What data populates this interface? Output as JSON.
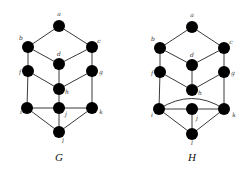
{
  "graphs": [
    {
      "name": "G",
      "label_pos": [
        59,
        161
      ],
      "nodes": [
        {
          "id": "a",
          "x": 59,
          "y": 26,
          "lx": 59,
          "ly": 16,
          "anchor": "middle"
        },
        {
          "id": "b",
          "x": 28,
          "y": 47,
          "lx": 21,
          "ly": 40,
          "anchor": "middle"
        },
        {
          "id": "c",
          "x": 92,
          "y": 47,
          "lx": 99,
          "ly": 43,
          "anchor": "middle"
        },
        {
          "id": "d",
          "x": 59,
          "y": 64,
          "lx": 59,
          "ly": 56,
          "anchor": "middle"
        },
        {
          "id": "f",
          "x": 28,
          "y": 71,
          "lx": 20,
          "ly": 74,
          "anchor": "middle"
        },
        {
          "id": "g",
          "x": 92,
          "y": 71,
          "lx": 101,
          "ly": 74,
          "anchor": "middle"
        },
        {
          "id": "h",
          "x": 59,
          "y": 89,
          "lx": 67,
          "ly": 94,
          "anchor": "middle"
        },
        {
          "id": "i",
          "x": 27,
          "y": 108,
          "lx": 21,
          "ly": 114,
          "anchor": "middle"
        },
        {
          "id": "j",
          "x": 59,
          "y": 108,
          "lx": 66,
          "ly": 116,
          "anchor": "middle"
        },
        {
          "id": "k",
          "x": 92,
          "y": 108,
          "lx": 101,
          "ly": 114,
          "anchor": "middle"
        },
        {
          "id": "l",
          "x": 59,
          "y": 132,
          "lx": 63,
          "ly": 143,
          "anchor": "middle"
        }
      ],
      "edges": [
        [
          "a",
          "b"
        ],
        [
          "a",
          "c"
        ],
        [
          "b",
          "d"
        ],
        [
          "c",
          "d"
        ],
        [
          "b",
          "f"
        ],
        [
          "c",
          "g"
        ],
        [
          "d",
          "h"
        ],
        [
          "f",
          "h"
        ],
        [
          "g",
          "h"
        ],
        [
          "f",
          "i"
        ],
        [
          "g",
          "k"
        ],
        [
          "h",
          "j"
        ],
        [
          "i",
          "j"
        ],
        [
          "j",
          "k"
        ],
        [
          "i",
          "l"
        ],
        [
          "j",
          "l"
        ],
        [
          "k",
          "l"
        ]
      ],
      "curved_edges": []
    },
    {
      "name": "H",
      "label_pos": [
        192,
        161
      ],
      "nodes": [
        {
          "id": "a",
          "x": 192,
          "y": 27,
          "lx": 192,
          "ly": 17,
          "anchor": "middle"
        },
        {
          "id": "b",
          "x": 160,
          "y": 48,
          "lx": 153,
          "ly": 41,
          "anchor": "middle"
        },
        {
          "id": "c",
          "x": 224,
          "y": 48,
          "lx": 231,
          "ly": 44,
          "anchor": "middle"
        },
        {
          "id": "d",
          "x": 192,
          "y": 65,
          "lx": 192,
          "ly": 57,
          "anchor": "middle"
        },
        {
          "id": "f",
          "x": 160,
          "y": 72,
          "lx": 152,
          "ly": 75,
          "anchor": "middle"
        },
        {
          "id": "g",
          "x": 224,
          "y": 72,
          "lx": 233,
          "ly": 75,
          "anchor": "middle"
        },
        {
          "id": "h",
          "x": 192,
          "y": 90,
          "lx": 200,
          "ly": 95,
          "anchor": "middle"
        },
        {
          "id": "i",
          "x": 159,
          "y": 109,
          "lx": 152,
          "ly": 117,
          "anchor": "middle"
        },
        {
          "id": "j",
          "x": 192,
          "y": 109,
          "lx": 197,
          "ly": 120,
          "anchor": "middle"
        },
        {
          "id": "k",
          "x": 224,
          "y": 109,
          "lx": 234,
          "ly": 117,
          "anchor": "middle"
        },
        {
          "id": "l",
          "x": 192,
          "y": 134,
          "lx": 192,
          "ly": 145,
          "anchor": "middle"
        }
      ],
      "edges": [
        [
          "a",
          "b"
        ],
        [
          "a",
          "c"
        ],
        [
          "b",
          "d"
        ],
        [
          "c",
          "d"
        ],
        [
          "b",
          "f"
        ],
        [
          "c",
          "g"
        ],
        [
          "d",
          "h"
        ],
        [
          "f",
          "h"
        ],
        [
          "g",
          "h"
        ],
        [
          "f",
          "i"
        ],
        [
          "g",
          "k"
        ],
        [
          "i",
          "j"
        ],
        [
          "j",
          "k"
        ],
        [
          "i",
          "l"
        ],
        [
          "j",
          "l"
        ],
        [
          "k",
          "l"
        ]
      ],
      "curved_edges": [
        {
          "from": "i",
          "to": "k",
          "cx": 192,
          "cy": 88
        }
      ]
    }
  ],
  "style": {
    "node_radius": 6,
    "node_color": "#000000",
    "edge_color": "#3a3a3a"
  }
}
